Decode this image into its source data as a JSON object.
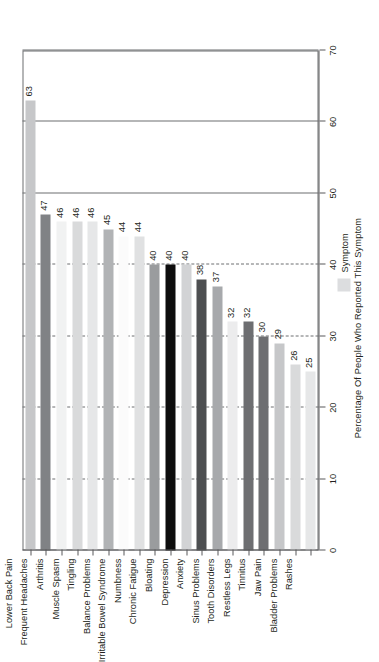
{
  "chart_data": {
    "type": "bar",
    "orientation": "vertical-rotated",
    "title": "",
    "xlabel": "",
    "ylabel": "Percentage Of People Who Reported This Symptom",
    "ylim": [
      0,
      70
    ],
    "yticks": [
      0,
      10,
      20,
      30,
      40,
      50,
      60,
      70
    ],
    "grid": true,
    "legend": {
      "position": "right",
      "entries": [
        "Symptom"
      ]
    },
    "categories": [
      "Lower Back Pain",
      "Frequent Headaches",
      "Arthritis",
      "Muscle Spasm",
      "Tingling",
      "Balance Problems",
      "Irritable Bowel Syndrome",
      "Numbness",
      "Chronic Fatigue",
      "Bloating",
      "Depression",
      "Anxiety",
      "Sinus Problems",
      "Tooth Disorders",
      "Restless Legs",
      "Tinnitus",
      "Jaw Pain",
      "Bladder Problems",
      "Rashes"
    ],
    "values": [
      63,
      47,
      46,
      46,
      46,
      45,
      44,
      44,
      40,
      40,
      40,
      38,
      37,
      32,
      32,
      30,
      29,
      26,
      25
    ],
    "colors": [
      "#c6c7c9",
      "#808285",
      "#f1f2f2",
      "#d9dadb",
      "#e6e7e8",
      "#b1b3b5",
      "#fbfbfb",
      "#e0e1e2",
      "#9a9c9e",
      "#0d0d0d",
      "#d2d3d5",
      "#4d4f51",
      "#a7a9ac",
      "#ececed",
      "#6d6e71",
      "#6d6e71",
      "#c6c7c9",
      "#d9dadb",
      "#e6e7e8"
    ],
    "bar_labels": [
      "63",
      "47",
      "46",
      "46",
      "46",
      "45",
      "44",
      "44",
      "40",
      "40",
      "40",
      "38",
      "37",
      "32",
      "32",
      "30",
      "29",
      "26",
      "25"
    ]
  },
  "axis": {
    "value_ticks": [
      "0",
      "10",
      "20",
      "30",
      "40",
      "50",
      "60",
      "70"
    ]
  },
  "legend": {
    "title": "Symptom",
    "swatch_color": "#dcdddf"
  },
  "labels": {
    "y_axis_title": "Percentage Of People Who Reported This Symptom"
  }
}
